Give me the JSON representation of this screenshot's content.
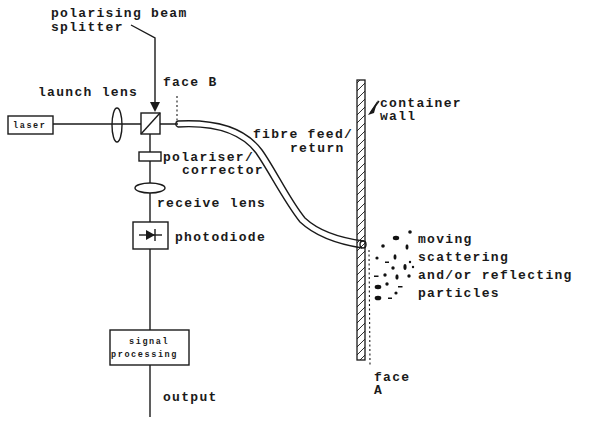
{
  "diagram": {
    "type": "optical-schematic",
    "labels": {
      "beam_splitter_line1": "polarising beam",
      "beam_splitter_line2": "splitter",
      "launch_lens": "launch lens",
      "face_b": "face B",
      "laser": "laser",
      "container_line1": "container",
      "container_line2": "wall",
      "fibre_line1": "fibre feed/",
      "fibre_line2": "return",
      "polariser_line1": "polariser/",
      "polariser_line2": "corrector",
      "receive_lens": "receive lens",
      "photodiode": "photodiode",
      "particles_line1": "moving",
      "particles_line2": "scattering",
      "particles_line3": "and/or reflecting",
      "particles_line4": "particles",
      "signal_line1": "signal",
      "signal_line2": "processing",
      "output": "output",
      "face_a_line1": "face",
      "face_a_line2": "A"
    },
    "components": [
      "laser",
      "launch-lens",
      "polarising-beam-splitter",
      "polariser-corrector",
      "receive-lens",
      "photodiode",
      "signal-processing",
      "fibre-feed-return",
      "container-wall",
      "particles"
    ],
    "colors": {
      "ink": "#1a1a1a",
      "background": "#ffffff"
    }
  }
}
